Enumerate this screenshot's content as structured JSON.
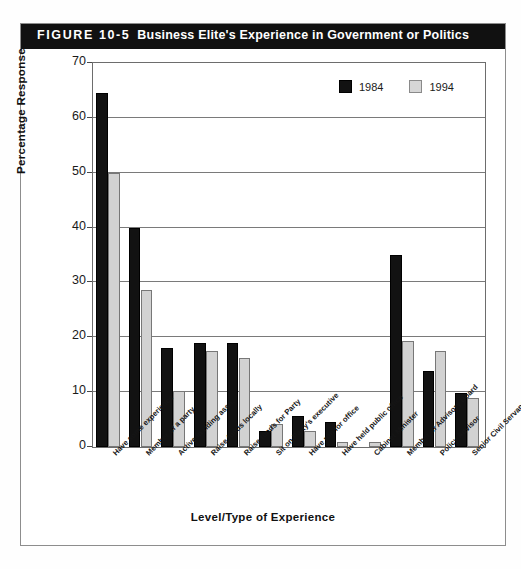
{
  "figure": {
    "number": "FIGURE 10-5",
    "title": "Business Elite's Experience in Government or Politics"
  },
  "chart_data": {
    "type": "bar",
    "title": "Business Elite's Experience in Government or Politics",
    "xlabel": "Level/Type of Experience",
    "ylabel": "Percentage Response",
    "ylim": [
      0,
      70
    ],
    "yticks": [
      0,
      10,
      20,
      30,
      40,
      50,
      60,
      70
    ],
    "grid": true,
    "legend_position": "top-right",
    "categories": [
      "Have some experience",
      "Member of a party",
      "Active in riding assn.",
      "Raise funds locally",
      "Raise funds for Party",
      "Sit on Party's executive",
      "Have run for office",
      "Have held public office",
      "Cabinet Minister",
      "Member of Advisory Board",
      "Policy Advisor",
      "Senior Civil Servant"
    ],
    "series": [
      {
        "name": "1984",
        "color": "#121212",
        "values": [
          64.5,
          40.0,
          18.0,
          19.0,
          19.0,
          3.0,
          5.7,
          4.5,
          0.0,
          35.0,
          13.8,
          9.8
        ]
      },
      {
        "name": "1994",
        "color": "#d2d2d2",
        "values": [
          50.0,
          28.7,
          10.3,
          17.5,
          16.3,
          4.2,
          3.0,
          0.9,
          0.9,
          19.3,
          17.5,
          9.0
        ]
      }
    ]
  }
}
